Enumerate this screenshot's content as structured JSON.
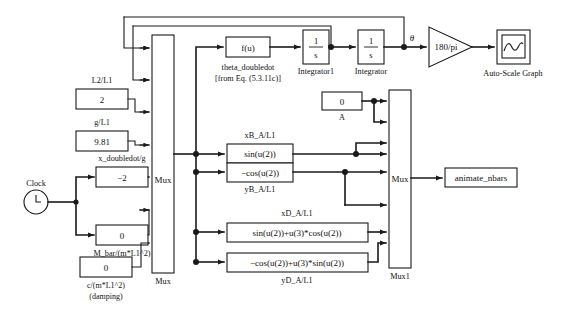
{
  "diagram": {
    "source_block": {
      "name": "Clock",
      "label": "Clock",
      "icon": "clock-icon"
    },
    "constant_blocks": [
      {
        "id": "L2_L1",
        "top_label": "L2/L1",
        "value": "2",
        "bottom_label": ""
      },
      {
        "id": "g_L1",
        "top_label": "g/L1",
        "value": "9.81",
        "bottom_label": ""
      },
      {
        "id": "x_ddot_g",
        "top_label": "x_doubledot/g",
        "value": "−2",
        "bottom_label": ""
      },
      {
        "id": "M_bar",
        "top_label": "",
        "value": "0",
        "bottom_label": "M_bar/(m*L1^2)"
      },
      {
        "id": "damping",
        "top_label": "",
        "value": "0",
        "bottom_label_1": "c/(m*L1^2)",
        "bottom_label_2": "(damping)"
      },
      {
        "id": "A_const",
        "top_label": "",
        "value": "0",
        "bottom_label": "A"
      }
    ],
    "mux_blocks": [
      {
        "id": "mux",
        "inner_text": "Mux",
        "name_label": "Mux",
        "inputs": 7
      },
      {
        "id": "mux1",
        "inner_text": "Mux",
        "name_label": "Mux1",
        "inputs": 6
      }
    ],
    "fcn_block": {
      "text": "f(u)",
      "caption_line_1": "theta_doubledot",
      "caption_line_2": "[from Eq. (5.3.11c)]"
    },
    "integrators": [
      {
        "id": "integrator1",
        "numerator": "1",
        "denominator": "s",
        "label": "Integrator1"
      },
      {
        "id": "integrator",
        "numerator": "1",
        "denominator": "s",
        "label": "Integrator"
      }
    ],
    "signal_labels": [
      {
        "id": "theta",
        "text": "θ"
      }
    ],
    "gain_block": {
      "text": "180/pi"
    },
    "scope_block": {
      "label": "Auto-Scale Graph",
      "icon": "scope-sine-icon"
    },
    "expression_blocks": [
      {
        "id": "xB",
        "top_label": "xB_A/L1",
        "text": "sin(u(2))",
        "bottom_label": ""
      },
      {
        "id": "yB",
        "top_label": "",
        "text": "−cos(u(2))",
        "bottom_label": "yB_A/L1"
      },
      {
        "id": "xD",
        "top_label": "xD_A/L1",
        "text": "sin(u(2))+u(3)*cos(u(2))",
        "bottom_label": ""
      },
      {
        "id": "yD",
        "top_label": "",
        "text": "−cos(u(2))+u(3)*sin(u(2))",
        "bottom_label": "yD_A/L1"
      }
    ],
    "sink_block": {
      "text": "animate_nbars"
    },
    "colors": {
      "line": "#1a1a1a",
      "block_fill": "#ffffff",
      "background": "#ffffff"
    }
  }
}
